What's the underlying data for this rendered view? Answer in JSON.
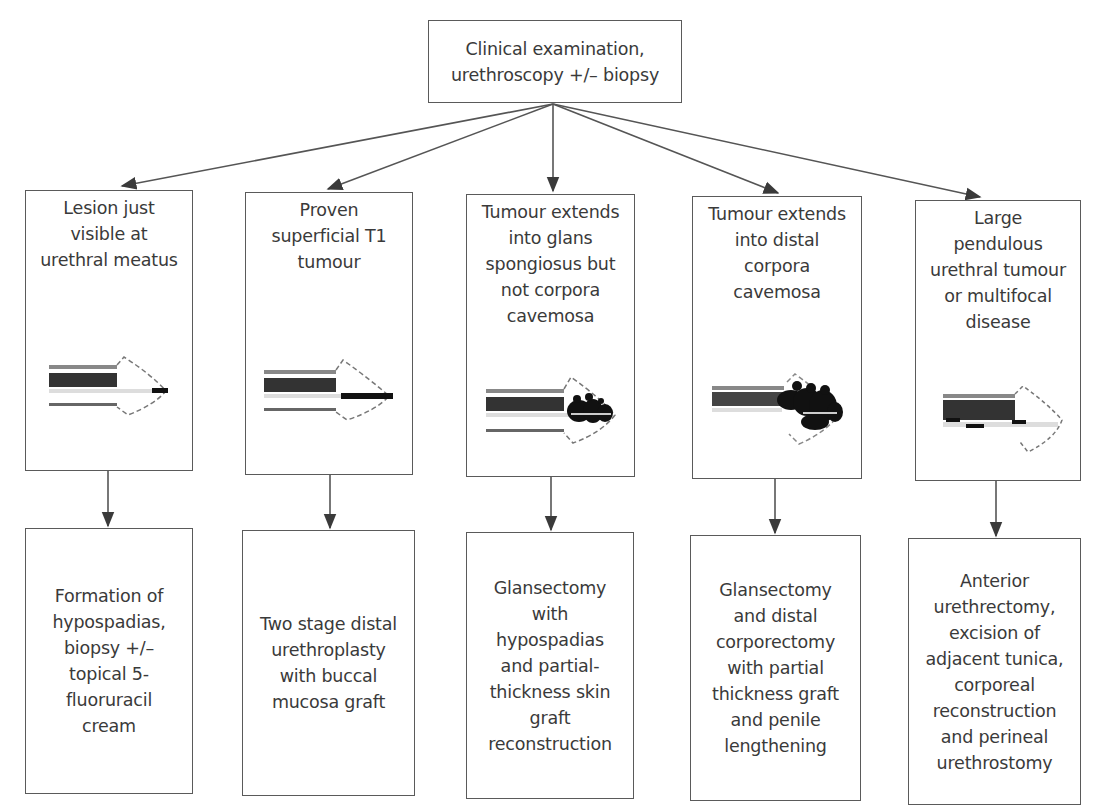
{
  "diagram": {
    "root": {
      "label": "Clinical examination,\nurethroscopy +/– biopsy"
    },
    "stages": [
      {
        "label": "Lesion just\nvisible at\nurethral meatus",
        "illustration": "urethra-meatus-lesion-icon"
      },
      {
        "label": "Proven\nsuperficial T1\ntumour",
        "illustration": "urethra-superficial-tumour-icon"
      },
      {
        "label": "Tumour extends\ninto glans\nspongiosus but\nnot corpora\ncavemosa",
        "illustration": "glans-spongiosus-tumour-icon"
      },
      {
        "label": "Tumour extends\ninto distal\ncorpora\ncavemosa",
        "illustration": "distal-corpora-tumour-icon"
      },
      {
        "label": "Large\npendulous\nurethral tumour\nor multifocal\ndisease",
        "illustration": "multifocal-tumour-icon"
      }
    ],
    "treatments": [
      {
        "label": "Formation of\nhypospadias,\nbiopsy +/–\ntopical 5-\nfluoruracil\ncream"
      },
      {
        "label": "Two stage distal\nurethroplasty\nwith buccal\nmucosa graft"
      },
      {
        "label": "Glansectomy\nwith\nhypospadias\nand partial-\nthickness skin\ngraft\nreconstruction"
      },
      {
        "label": "Glansectomy\nand distal\ncorporectomy\nwith partial\nthickness graft\nand penile\nlengthening"
      },
      {
        "label": "Anterior\nurethrectomy,\nexcision of\nadjacent tunica,\ncorporeal\nreconstruction\nand perineal\nurethrostomy"
      }
    ],
    "colors": {
      "line": "#4a4a4a",
      "text": "#3a3a3a",
      "tumour": "#111111",
      "tissue": "#555555"
    }
  }
}
